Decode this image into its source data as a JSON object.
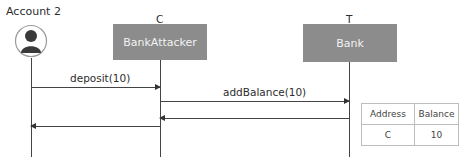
{
  "actors": [
    {
      "id": "account",
      "title": "Account 2",
      "type": "user"
    },
    {
      "id": "C",
      "title": "C",
      "box_label": "BankAttacker"
    },
    {
      "id": "T",
      "title": "T",
      "box_label": "Bank"
    }
  ],
  "messages": [
    {
      "from": "Account 2",
      "to": "C",
      "label": "deposit(10)"
    },
    {
      "from": "C",
      "to": "T",
      "label": "addBalance(10)"
    },
    {
      "from": "T",
      "to": "C",
      "label": ""
    },
    {
      "from": "C",
      "to": "Account 2",
      "label": ""
    }
  ],
  "state_table": {
    "headers": [
      "Address",
      "Balance"
    ],
    "rows": [
      [
        "C",
        "10"
      ]
    ]
  },
  "colors": {
    "box": "#8c8c8c",
    "box_text": "#f2f2f2",
    "line": "#444444"
  }
}
